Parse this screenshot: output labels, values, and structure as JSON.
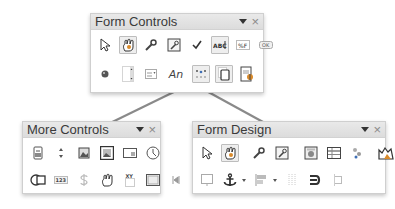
{
  "form_controls": {
    "title": "Form Controls",
    "menu_icon": "dropdown-arrow",
    "close_icon": "×",
    "row1": [
      {
        "name": "select-icon",
        "active": false
      },
      {
        "name": "design-mode-icon",
        "active": true
      },
      {
        "name": "control-properties-icon",
        "active": false
      },
      {
        "name": "form-properties-icon",
        "active": false
      },
      {
        "name": "check-box-icon",
        "active": false
      },
      {
        "name": "text-box-icon",
        "active": true
      },
      {
        "name": "formatted-field-icon",
        "active": false
      },
      {
        "name": "push-button-icon",
        "active": false
      }
    ],
    "row2": [
      {
        "name": "option-button-icon",
        "active": false
      },
      {
        "name": "list-box-icon",
        "active": false
      },
      {
        "name": "combo-box-icon",
        "active": false
      },
      {
        "name": "label-field-icon",
        "label": "An",
        "active": false
      },
      {
        "name": "more-controls-icon",
        "active": true
      },
      {
        "name": "form-design-icon",
        "active": true
      },
      {
        "name": "wizards-icon",
        "active": false
      }
    ]
  },
  "more_controls": {
    "title": "More Controls",
    "menu_icon": "dropdown-arrow",
    "close_icon": "×",
    "row1": [
      {
        "name": "numerical-field-icon"
      },
      {
        "name": "spin-button-icon"
      },
      {
        "name": "image-button-icon"
      },
      {
        "name": "image-control-icon"
      },
      {
        "name": "date-field-icon"
      },
      {
        "name": "time-field-icon"
      }
    ],
    "row2": [
      {
        "name": "group-box-icon"
      },
      {
        "name": "numeric-field-icon",
        "label": "123"
      },
      {
        "name": "currency-field-icon"
      },
      {
        "name": "pattern-field-icon"
      },
      {
        "name": "formatted-xy-field-icon",
        "label": "XY"
      },
      {
        "name": "table-control-icon"
      },
      {
        "name": "navigation-bar-icon"
      }
    ]
  },
  "form_design": {
    "title": "Form Design",
    "menu_icon": "dropdown-arrow",
    "close_icon": "×",
    "row1": [
      {
        "name": "select-icon",
        "active": false
      },
      {
        "name": "design-mode-icon",
        "active": true
      },
      {
        "name": "control-properties-icon",
        "active": false
      },
      {
        "name": "form-properties-icon",
        "active": false
      },
      {
        "name": "form-navigator-icon",
        "active": false
      },
      {
        "name": "add-field-icon",
        "active": false
      },
      {
        "name": "activation-order-icon",
        "active": false
      },
      {
        "name": "open-in-design-mode-icon",
        "active": false
      },
      {
        "name": "automatic-control-focus-icon",
        "active": false
      }
    ],
    "row2": [
      {
        "name": "position-and-size-icon"
      },
      {
        "name": "anchor-icon",
        "dropdown": true
      },
      {
        "name": "alignment-icon",
        "dropdown": true
      },
      {
        "name": "display-grid-icon"
      },
      {
        "name": "wrap-icon"
      },
      {
        "name": "snap-to-grid-icon"
      }
    ]
  },
  "colors": {
    "titlebar": "#e0e0e0",
    "connector": "#8a8a8a",
    "icon_dark": "#444444",
    "icon_blue": "#3f6fb5",
    "icon_orange": "#d98a2a"
  }
}
